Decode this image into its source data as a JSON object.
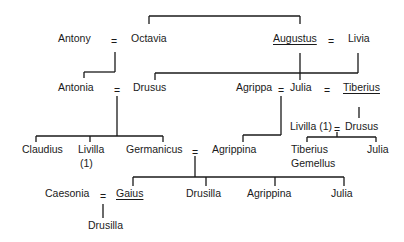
{
  "diagram": {
    "type": "family-tree",
    "title": "",
    "persons": {
      "antony": "Antony",
      "octavia": "Octavia",
      "augustus": "Augustus",
      "livia": "Livia",
      "antonia": "Antonia",
      "drusus_elder": "Drusus",
      "agrippa": "Agrippa",
      "julia_elder": "Julia",
      "tiberius": "Tiberius",
      "livilla_1": "Livilla (1)",
      "drusus_younger": "Drusus",
      "claudius": "Claudius",
      "livilla": "Livilla",
      "livilla_note": "(1)",
      "germanicus": "Germanicus",
      "agrippina_elder": "Agrippina",
      "tiberius_gemellus_1": "Tiberius",
      "tiberius_gemellus_2": "Gemellus",
      "julia_livilla_daughter": "Julia",
      "caesonia": "Caesonia",
      "gaius": "Gaius",
      "drusilla": "Drusilla",
      "agrippina_younger": "Agrippina",
      "julia_younger": "Julia",
      "drusilla_daughter": "Drusilla"
    },
    "marriage_symbol": "=",
    "underlined": [
      "Augustus",
      "Tiberius",
      "Gaius"
    ],
    "marriages": [
      [
        "Antony",
        "Octavia"
      ],
      [
        "Augustus",
        "Livia"
      ],
      [
        "Antonia",
        "Drusus"
      ],
      [
        "Agrippa",
        "Julia"
      ],
      [
        "Julia",
        "Tiberius"
      ],
      [
        "Livilla (1)",
        "Drusus"
      ],
      [
        "Germanicus",
        "Agrippina"
      ],
      [
        "Caesonia",
        "Gaius"
      ]
    ],
    "siblings": [
      [
        "Octavia",
        "Augustus"
      ]
    ],
    "children": [
      {
        "parents": [
          "Antony",
          "Octavia"
        ],
        "children": [
          "Antonia"
        ]
      },
      {
        "parents": [
          "Augustus",
          "Livia"
        ],
        "children": [
          "Drusus",
          "Julia",
          "Tiberius"
        ]
      },
      {
        "parents": [
          "Antonia",
          "Drusus"
        ],
        "children": [
          "Claudius",
          "Livilla (1)",
          "Germanicus"
        ]
      },
      {
        "parents": [
          "Agrippa",
          "Julia"
        ],
        "children": [
          "Agrippina"
        ]
      },
      {
        "parents": [
          "Tiberius"
        ],
        "children": [
          "Drusus"
        ]
      },
      {
        "parents": [
          "Livilla (1)",
          "Drusus"
        ],
        "children": [
          "Tiberius Gemellus",
          "Julia"
        ]
      },
      {
        "parents": [
          "Germanicus",
          "Agrippina"
        ],
        "children": [
          "Gaius",
          "Drusilla",
          "Agrippina",
          "Julia"
        ]
      },
      {
        "parents": [
          "Caesonia",
          "Gaius"
        ],
        "children": [
          "Drusilla"
        ]
      }
    ]
  }
}
